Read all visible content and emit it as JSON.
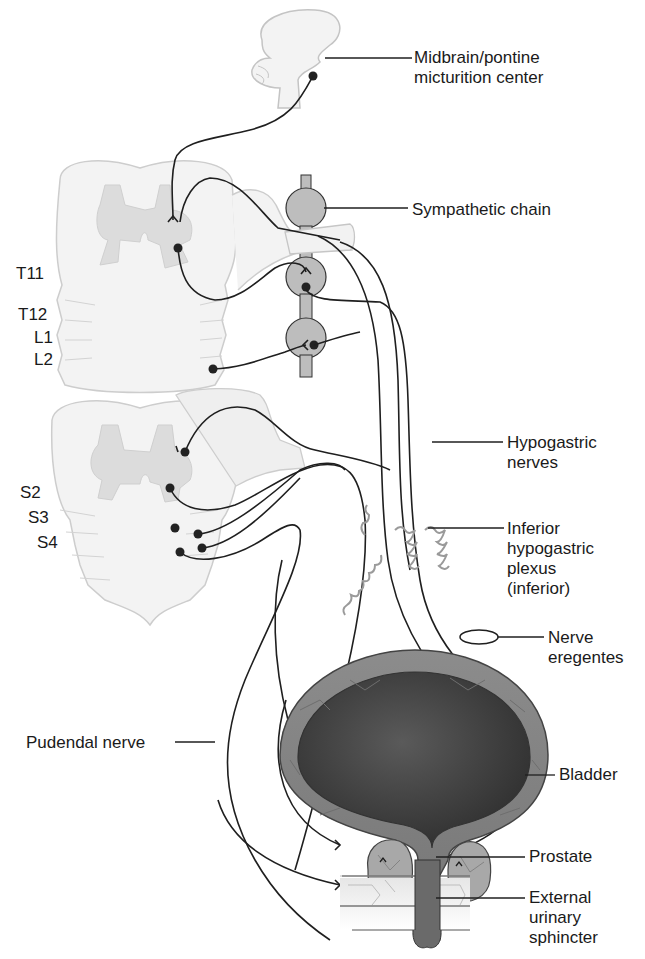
{
  "diagram": {
    "type": "anatomical-neural-pathway",
    "structures": {
      "brainstem": "Midbrain/pontine micturition center",
      "sympathetic_chain": "Sympathetic chain",
      "hypogastric": "Hypogastric nerves",
      "plexus": "Inferior hypogastric plexus (inferior)",
      "eregentes": "Nerve eregentes",
      "bladder": "Bladder",
      "prostate": "Prostate",
      "sphincter": "External urinary sphincter",
      "pudendal": "Pudendal nerve"
    }
  },
  "labels": {
    "micturition_center": "Midbrain/pontine\nmicturition center",
    "sympathetic_chain": "Sympathetic chain",
    "hypogastric_nerves": "Hypogastric\nnerves",
    "inferior_plexus": "Inferior\nhypogastric\nplexus\n(inferior)",
    "nerve_eregentes": "Nerve\neregentes",
    "bladder": "Bladder",
    "pudendal_nerve": "Pudendal nerve",
    "prostate": "Prostate",
    "external_sphincter": "External\nurinary\nsphincter"
  },
  "segments": {
    "upper": [
      "T11",
      "T12",
      "L1",
      "L2"
    ],
    "lower": [
      "S2",
      "S3",
      "S4"
    ]
  },
  "colors": {
    "cord_fill": "#f2f2f2",
    "cord_outline": "#c8c8c8",
    "gray_matter": "#d9d9d9",
    "ganglion": "#bdbdbd",
    "nerve": "#1f1f1f",
    "plexus": "#9a9a9a",
    "bladder_wall": "#8a8a8a",
    "bladder_lumen": "#4a4a4a"
  }
}
